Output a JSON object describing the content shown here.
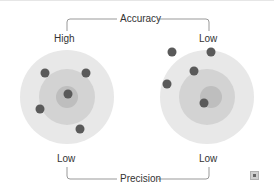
{
  "diagram": {
    "top_label": "Accuracy",
    "bottom_label": "Precision",
    "left_target": {
      "accuracy": "High",
      "precision": "Low",
      "center": [
        67,
        97
      ],
      "rings": [
        33,
        19,
        9
      ],
      "dots": [
        [
          45,
          74
        ],
        [
          86,
          74
        ],
        [
          67,
          93
        ],
        [
          40,
          109
        ],
        [
          80,
          129
        ]
      ]
    },
    "right_target": {
      "accuracy": "Low",
      "precision": "Low",
      "center": [
        207,
        97
      ],
      "rings": [
        42,
        27,
        12
      ],
      "dots": [
        [
          172,
          52
        ],
        [
          211,
          52
        ],
        [
          195,
          71
        ],
        [
          167,
          84
        ],
        [
          205,
          103
        ]
      ]
    },
    "colors": {
      "outer_ring": "#e6e6e6",
      "middle_ring": "#d2d2d2",
      "inner_ring": "#bdbdbd",
      "dot": "#5a5a5a",
      "line": "#999999",
      "text": "#333333"
    }
  },
  "expand_icon": "expand-icon"
}
